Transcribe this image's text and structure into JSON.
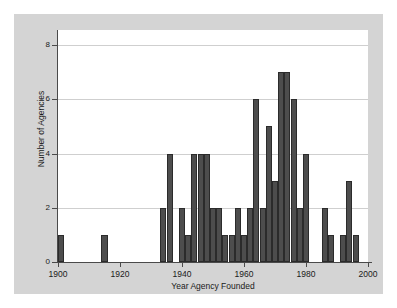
{
  "chart_data": {
    "type": "bar",
    "title": "",
    "xlabel": "Year Agency Founded",
    "ylabel": "Number of Agencies",
    "xlim": [
      1900,
      2000
    ],
    "ylim": [
      0,
      8
    ],
    "xticks": [
      1900,
      1920,
      1940,
      1960,
      1980,
      2000
    ],
    "yticks": [
      0,
      2,
      4,
      6,
      8
    ],
    "grid": "horizontal",
    "legend": "none",
    "bar_color": "#4d4d4d",
    "bin_width": 2,
    "categories": [
      1901,
      1915,
      1934,
      1936,
      1940,
      1942,
      1944,
      1946,
      1948,
      1950,
      1952,
      1954,
      1956,
      1958,
      1960,
      1962,
      1964,
      1966,
      1968,
      1970,
      1972,
      1974,
      1976,
      1978,
      1980,
      1986,
      1988,
      1992,
      1994,
      1996
    ],
    "values": [
      1,
      1,
      2,
      4,
      2,
      1,
      4,
      4,
      4,
      2,
      2,
      1,
      1,
      2,
      1,
      2,
      6,
      2,
      5,
      3,
      7,
      7,
      6,
      2,
      4,
      2,
      1,
      1,
      3,
      1
    ],
    "bars": [
      {
        "year": 1901,
        "count": 1
      },
      {
        "year": 1915,
        "count": 1
      },
      {
        "year": 1934,
        "count": 2
      },
      {
        "year": 1936,
        "count": 4
      },
      {
        "year": 1940,
        "count": 2
      },
      {
        "year": 1942,
        "count": 1
      },
      {
        "year": 1944,
        "count": 4
      },
      {
        "year": 1946,
        "count": 4
      },
      {
        "year": 1948,
        "count": 4
      },
      {
        "year": 1950,
        "count": 2
      },
      {
        "year": 1952,
        "count": 2
      },
      {
        "year": 1954,
        "count": 1
      },
      {
        "year": 1956,
        "count": 1
      },
      {
        "year": 1958,
        "count": 2
      },
      {
        "year": 1960,
        "count": 1
      },
      {
        "year": 1962,
        "count": 2
      },
      {
        "year": 1964,
        "count": 6
      },
      {
        "year": 1966,
        "count": 2
      },
      {
        "year": 1968,
        "count": 5
      },
      {
        "year": 1970,
        "count": 3
      },
      {
        "year": 1972,
        "count": 7
      },
      {
        "year": 1974,
        "count": 7
      },
      {
        "year": 1976,
        "count": 6
      },
      {
        "year": 1978,
        "count": 2
      },
      {
        "year": 1980,
        "count": 4
      },
      {
        "year": 1986,
        "count": 2
      },
      {
        "year": 1988,
        "count": 1
      },
      {
        "year": 1992,
        "count": 1
      },
      {
        "year": 1994,
        "count": 3
      },
      {
        "year": 1996,
        "count": 1
      }
    ]
  },
  "axes": {
    "x_tick_labels": [
      "1900",
      "1920",
      "1940",
      "1960",
      "1980",
      "2000"
    ],
    "y_tick_labels": [
      "0",
      "2",
      "4",
      "6",
      "8"
    ],
    "x_axis_title": "Year Agency Founded",
    "y_axis_title": "Number of Agencies"
  },
  "colors": {
    "figure_background": "#d4d4d4",
    "plot_background": "#ffffff",
    "bar_fill": "#4d4d4d",
    "bar_edge": "#2b2b2b",
    "axis": "#4a4a4a",
    "gridline": "#cfcfcf",
    "text": "#1a1a1a"
  }
}
